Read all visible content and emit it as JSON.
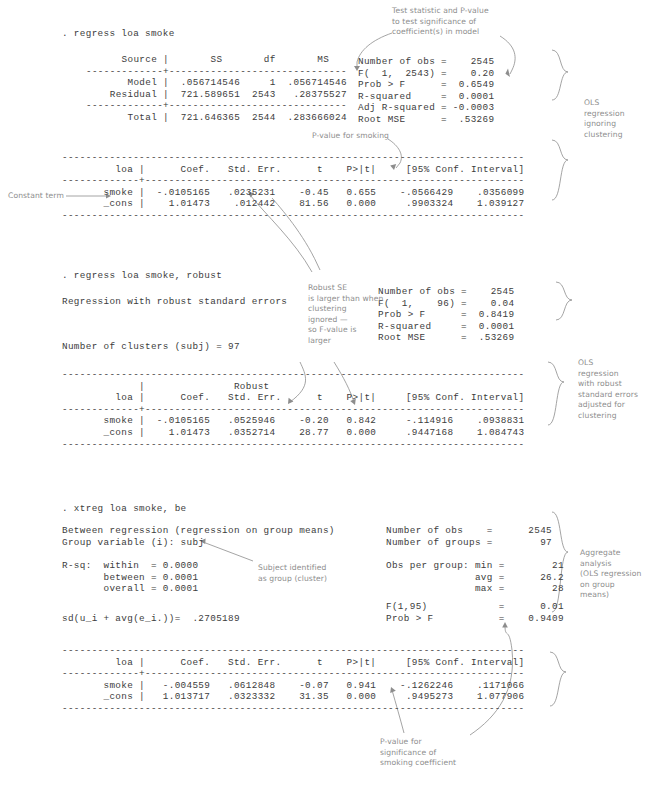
{
  "meta": {
    "colors": {
      "console_text": "#3c3c3c",
      "annotation_text": "#8d8d8d",
      "background": "#ffffff"
    }
  },
  "blocks": [
    {
      "id": "ols-plain",
      "command": ". regress loa smoke",
      "anova": [
        "      Source |       SS       df       MS",
        "-------------+------------------------------",
        "       Model |  .056714546     1  .056714546",
        "    Residual |  721.589651  2543   .28375527",
        "-------------+------------------------------",
        "       Total |  721.646365  2544  .283666024"
      ],
      "stats": [
        "Number of obs =    2545",
        "F(  1,  2543) =    0.20",
        "Prob > F      =  0.6549",
        "R-squared     =  0.0001",
        "Adj R-squared = -0.0003",
        "Root MSE      =  .53269"
      ],
      "coef_table": [
        "------------------------------------------------------------------------------",
        "         loa |      Coef.   Std. Err.      t    P>|t|     [95% Conf. Interval]",
        "-------------+----------------------------------------------------------------",
        "       smoke |  -.0105165   .0235231    -0.45   0.655    -.0566429    .0356099",
        "       _cons |    1.01473    .012442    81.56   0.000     .9903324    1.039127",
        "------------------------------------------------------------------------------"
      ]
    },
    {
      "id": "ols-robust",
      "command": ". regress loa smoke, robust",
      "header_lines": [
        "Regression with robust standard errors",
        "Number of clusters (subj) = 97"
      ],
      "stats": [
        "Number of obs =    2545",
        "F(  1,    96) =    0.04",
        "Prob > F      =  0.8419",
        "R-squared     =  0.0001",
        "Root MSE      =  .53269"
      ],
      "coef_table": [
        "------------------------------------------------------------------------------",
        "             |               Robust",
        "         loa |      Coef.   Std. Err.      t    P>|t|     [95% Conf. Interval]",
        "-------------+----------------------------------------------------------------",
        "       smoke |  -.0105165   .0525946    -0.20   0.842     -.114916    .0938831",
        "       _cons |    1.01473   .0352714    28.77   0.000     .9447168    1.084743",
        "------------------------------------------------------------------------------"
      ]
    },
    {
      "id": "xtreg-between",
      "command": ". xtreg loa smoke, be",
      "header_lines": [
        "Between regression (regression on group means)",
        "Group variable (i): subj"
      ],
      "rsq_lines": [
        "R-sq:  within  = 0.0000",
        "       between = 0.0001",
        "       overall = 0.0001"
      ],
      "sd_line": "sd(u_i + avg(e_i.))=  .2705189",
      "stats_top": [
        "Number of obs    =      2545",
        "Number of groups =        97"
      ],
      "stats_group": [
        "Obs per group: min =        21",
        "               avg =      26.2",
        "               max =        28"
      ],
      "stats_f": [
        "F(1,95)            =      0.01",
        "Prob > F           =    0.9409"
      ],
      "coef_table": [
        "------------------------------------------------------------------------------",
        "         loa |      Coef.   Std. Err.      t    P>|t|     [95% Conf. Interval]",
        "-------------+----------------------------------------------------------------",
        "       smoke |   -.004559   .0612848    -0.07   0.941    -.1262246    .1171066",
        "       _cons |   1.013717   .0323332    31.35   0.000     .9495273    1.077906",
        "------------------------------------------------------------------------------"
      ]
    }
  ],
  "annotations": {
    "test_statistic": "Test statistic and P-value\nto test significance of\ncoefficient(s) in model",
    "ols_ignoring_clustering": "OLS\nregression\nignoring\nclustering",
    "pvalue_for_smoking": "P-value for smoking",
    "constant_term": "Constant term",
    "robust_se": "Robust SE\nis larger than when\nclustering\nignored —\nso F-value is\nlarger",
    "ols_robust_adjusted": "OLS\nregression\nwith robust\nstandard errors\nadjusted for\nclustering",
    "subject_identified": "Subject identified\nas group (cluster)",
    "aggregate_analysis": "Aggregate\nanalysis\n(OLS regression\non group\nmeans)",
    "pvalue_smoking_coefficient": "P-value for\nsignificance of\nsmoking coefficient"
  }
}
